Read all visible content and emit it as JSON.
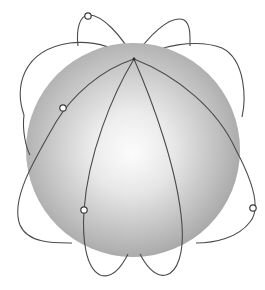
{
  "diagram": {
    "sphere": {
      "cx": 133,
      "cy": 150,
      "r": 107,
      "highlight_color": "#ffffff",
      "mid_color": "#d4d4d4",
      "edge_color": "#9c9c9c"
    },
    "orbit_color": "#4a4a4a",
    "convergence_point": {
      "x": 134,
      "y": 59
    },
    "satellites": [
      {
        "id": "sat-top",
        "x": 88,
        "y": 16
      },
      {
        "id": "sat-left",
        "x": 63,
        "y": 108
      },
      {
        "id": "sat-lower-left",
        "x": 84,
        "y": 210
      },
      {
        "id": "sat-right",
        "x": 253,
        "y": 208
      }
    ]
  }
}
